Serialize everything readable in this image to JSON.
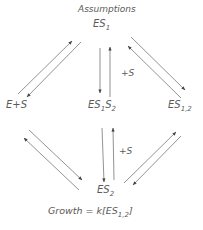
{
  "title": "Assumptions",
  "nodes": {
    "top": {
      "base": "ES",
      "sub": "1"
    },
    "left": {
      "text": "E+S"
    },
    "center": {
      "base": "ES",
      "sub1": "1",
      "base2": "S",
      "sub2": "2"
    },
    "right": {
      "base": "ES",
      "sub": "1,2"
    },
    "bottom": {
      "base": "ES",
      "sub": "2"
    }
  },
  "edge_labels": {
    "upper_center": "+S",
    "lower_center": "+S"
  },
  "formula": {
    "prefix": "Growth = k[ES",
    "sub": "1,2",
    "suffix": "]"
  },
  "colors": {
    "line": "#666666",
    "text": "#5a5a5a"
  }
}
